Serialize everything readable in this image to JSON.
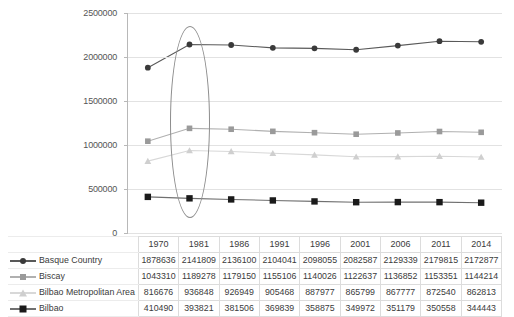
{
  "chart_data": {
    "type": "line",
    "title": "",
    "xlabel": "",
    "ylabel": "",
    "ylim": [
      0,
      2500000
    ],
    "ytick_step": 500000,
    "yticks": [
      "0",
      "500000",
      "1000000",
      "1500000",
      "2000000",
      "2500000"
    ],
    "grid": true,
    "legend_position": "table-row-labels",
    "categories": [
      "1970",
      "1981",
      "1986",
      "1991",
      "1996",
      "2001",
      "2006",
      "2011",
      "2014"
    ],
    "series": [
      {
        "name": "Basque Country",
        "marker": "circle",
        "color": "#3a3a3a",
        "line_color": "#595959",
        "values": [
          1878636,
          2141809,
          2136100,
          2104041,
          2098055,
          2082587,
          2129339,
          2179815,
          2172877
        ]
      },
      {
        "name": "Biscay",
        "marker": "square",
        "color": "#9a9a9a",
        "line_color": "#b0b0b0",
        "values": [
          1043310,
          1189278,
          1179150,
          1155106,
          1140026,
          1122637,
          1136852,
          1153351,
          1144214
        ]
      },
      {
        "name": "Bilbao Metropolitan Area",
        "marker": "triangle",
        "color": "#cfcfcf",
        "line_color": "#d8d8d8",
        "values": [
          816676,
          936848,
          926949,
          905468,
          887977,
          865799,
          867777,
          872540,
          862813
        ]
      },
      {
        "name": "Bilbao",
        "marker": "square",
        "color": "#1a1a1a",
        "line_color": "#707070",
        "values": [
          410490,
          393821,
          381506,
          369839,
          358875,
          349972,
          351179,
          350558,
          344443
        ]
      }
    ],
    "annotations": [
      {
        "type": "ellipse",
        "name": "highlight-ellipse-1981",
        "category": "1981",
        "stroke": "#8d8d8d"
      }
    ]
  },
  "table": {
    "corner_label": "",
    "columns": [
      "1970",
      "1981",
      "1986",
      "1991",
      "1996",
      "2001",
      "2006",
      "2011",
      "2014"
    ],
    "rows": [
      {
        "label": "Basque Country",
        "values": [
          "1878636",
          "2141809",
          "2136100",
          "2104041",
          "2098055",
          "2082587",
          "2129339",
          "2179815",
          "2172877"
        ]
      },
      {
        "label": "Biscay",
        "values": [
          "1043310",
          "1189278",
          "1179150",
          "1155106",
          "1140026",
          "1122637",
          "1136852",
          "1153351",
          "1144214"
        ]
      },
      {
        "label": "Bilbao Metropolitan Area",
        "values": [
          "816676",
          "936848",
          "926949",
          "905468",
          "887977",
          "865799",
          "867777",
          "872540",
          "862813"
        ]
      },
      {
        "label": "Bilbao",
        "values": [
          "410490",
          "393821",
          "381506",
          "369839",
          "358875",
          "349972",
          "351179",
          "350558",
          "344443"
        ]
      }
    ]
  }
}
